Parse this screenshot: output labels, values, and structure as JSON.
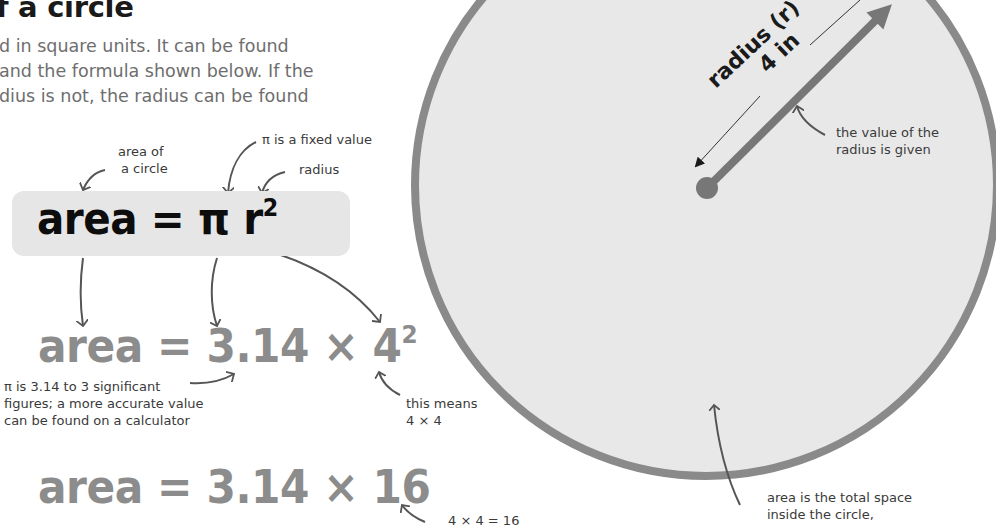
{
  "title": "f a circle",
  "intro_lines": [
    "d in square units. It can be found",
    "and the formula shown below. If the",
    "dius is not, the radius can be found"
  ],
  "annotations": {
    "area_of_circle": [
      "area of",
      "a circle"
    ],
    "pi_fixed": "π is a fixed value",
    "radius": "radius",
    "pi_sig_figs": [
      "π is 3.14 to 3 significant",
      "figures; a more accurate value",
      "can be found on a calculator"
    ],
    "this_means": [
      "this means",
      "4 × 4"
    ],
    "four_by_four": "4 × 4 = 16",
    "radius_given": [
      "the value of the",
      "radius is given"
    ],
    "area_total": [
      "area is the total space",
      "inside the circle,"
    ]
  },
  "formulas": {
    "main": {
      "lhs": "area = π r",
      "exp": "2"
    },
    "step1": {
      "lhs": "area = 3.14 × 4",
      "exp": "2"
    },
    "step2": {
      "lhs": "area = 3.14 × 16"
    }
  },
  "circle_label": {
    "line1": "radius (r) =",
    "line2": "4 in"
  },
  "colors": {
    "circle_fill": "#e8e8e8",
    "circle_stroke": "#8a8a8a",
    "formula_box": "#e6e6e6",
    "formula_main": "#0d0d0d",
    "formula_grey": "#8c8c8c",
    "arrow": "#555555"
  }
}
